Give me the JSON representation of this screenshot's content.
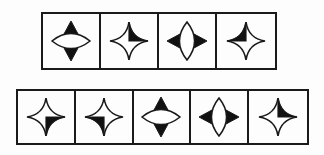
{
  "diagram": {
    "stroke_color": "#1a1a1a",
    "fill_color": "#111111",
    "background": "#ffffff",
    "rows": [
      {
        "name": "question-row",
        "left": 41,
        "top": 12,
        "width": 236,
        "height": 58,
        "cells": [
          {
            "index": 1,
            "black_points": [
              "top",
              "bottom"
            ],
            "shape": "horizontal-lens"
          },
          {
            "index": 2,
            "black_points": [
              "top",
              "right"
            ],
            "shape": "star"
          },
          {
            "index": 3,
            "black_points": [
              "left",
              "right"
            ],
            "shape": "vertical-lens"
          },
          {
            "index": 4,
            "black_points": [
              "top",
              "left"
            ],
            "shape": "star"
          }
        ]
      },
      {
        "name": "options-row",
        "left": 16,
        "top": 89,
        "width": 293,
        "height": 56,
        "cells": [
          {
            "index": 1,
            "black_points": [
              "right",
              "bottom"
            ],
            "shape": "star"
          },
          {
            "index": 2,
            "black_points": [
              "left",
              "bottom"
            ],
            "shape": "star"
          },
          {
            "index": 3,
            "black_points": [
              "top",
              "bottom"
            ],
            "shape": "horizontal-lens"
          },
          {
            "index": 4,
            "black_points": [
              "left",
              "right"
            ],
            "shape": "vertical-lens"
          },
          {
            "index": 5,
            "black_points": [
              "top",
              "right"
            ],
            "shape": "star"
          }
        ]
      }
    ]
  }
}
